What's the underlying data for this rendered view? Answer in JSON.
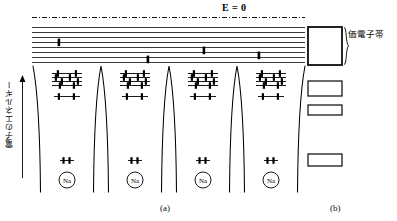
{
  "figure": {
    "title_a": "(a)",
    "title_b": "(b)",
    "energy_zero_label": "E = 0",
    "y_axis_label": "電子のエネルギー",
    "valence_band_label": "価電子帯",
    "atom_label": "Na"
  },
  "colors": {
    "line": "#000000",
    "band_line": "#2b2b2b",
    "well_curve": "#000000",
    "box_stroke": "#1a1a1a",
    "background": "#ffffff"
  },
  "panel_a": {
    "num_wells": 4,
    "well_centers_px": [
      67,
      135,
      203,
      271
    ],
    "well_spacing_px": 68,
    "conduction_band": {
      "name": "conduction-band",
      "num_levels": 8,
      "top_y_px": 27,
      "bottom_y_px": 64,
      "left_x_px": 32,
      "right_x_px": 305,
      "electrons": [
        {
          "x_px": 59,
          "y_px": 42
        },
        {
          "x_px": 148,
          "y_px": 59
        },
        {
          "x_px": 204,
          "y_px": 50
        },
        {
          "x_px": 259,
          "y_px": 55
        }
      ]
    },
    "zero_line": {
      "name": "e-zero-dashdot-line",
      "y_px": 17,
      "left_x_px": 32,
      "right_x_px": 305,
      "style": "dash-dot"
    },
    "atomic_levels": {
      "p_cluster": {
        "label": "2p",
        "num_lines": 4,
        "top_y_px": 73,
        "spacing_px": 4.2,
        "half_width_px": 15,
        "electron_pairs_per_line": 2
      },
      "s_level": {
        "label": "2s",
        "y_px": 96,
        "half_width_px": 13,
        "electron_pairs": 1
      },
      "core_level": {
        "label": "1s",
        "y_px": 160,
        "half_width_px": 7,
        "electron_pairs": 1
      }
    },
    "nucleus": {
      "label": "Na",
      "y_px": 180,
      "radius_px": 8
    }
  },
  "panel_b": {
    "bands": [
      {
        "name": "valence-band-box",
        "x_px": 308,
        "y_px": 27,
        "w_px": 34,
        "h_px": 38,
        "stroke_px": 1.8,
        "labeled": true
      },
      {
        "name": "band-box-2",
        "x_px": 308,
        "y_px": 81,
        "w_px": 34,
        "h_px": 15,
        "stroke_px": 1.4,
        "labeled": false
      },
      {
        "name": "band-box-3",
        "x_px": 308,
        "y_px": 105,
        "w_px": 34,
        "h_px": 10,
        "stroke_px": 1.4,
        "labeled": false
      },
      {
        "name": "band-box-4",
        "x_px": 308,
        "y_px": 154,
        "w_px": 34,
        "h_px": 12,
        "stroke_px": 1.4,
        "labeled": false
      }
    ],
    "brace": {
      "x_px": 344,
      "top_y_px": 27,
      "bottom_y_px": 65
    }
  }
}
